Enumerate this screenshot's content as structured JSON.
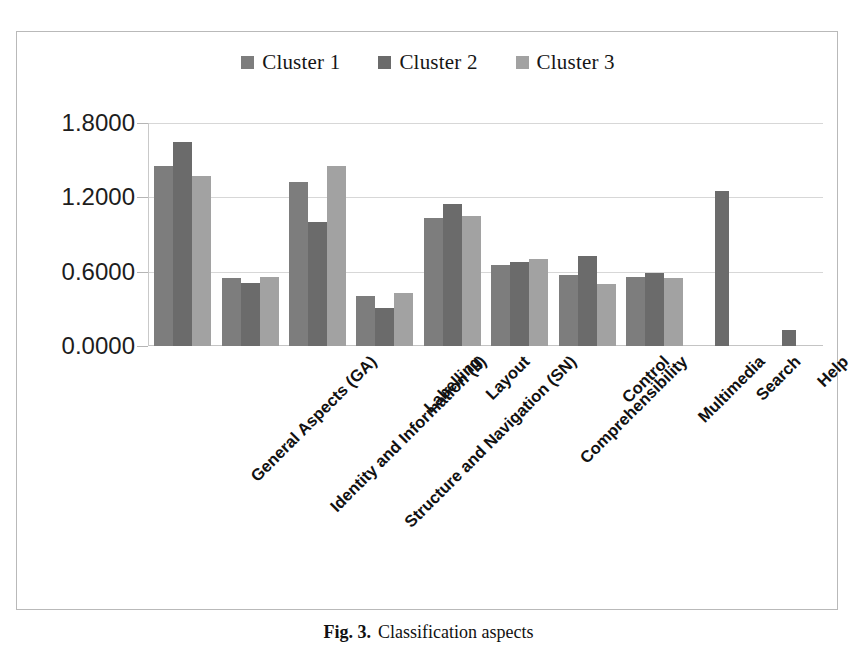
{
  "figure": {
    "caption_label": "Fig. 3.",
    "caption_text": "Classification aspects"
  },
  "legend": {
    "position": "top-center",
    "items": [
      {
        "label": "Cluster 1",
        "color": "#7d7d7d",
        "icon": "square-swatch"
      },
      {
        "label": "Cluster 2",
        "color": "#6b6b6b",
        "icon": "square-swatch"
      },
      {
        "label": "Cluster 3",
        "color": "#a2a2a2",
        "icon": "square-swatch"
      }
    ]
  },
  "axis": {
    "yticks": [
      "0.0000",
      "0.6000",
      "1.2000",
      "1.8000"
    ],
    "ytick_values": [
      0.0,
      0.6,
      1.2,
      1.8
    ]
  },
  "chart_data": {
    "type": "bar",
    "title": "Classification aspects",
    "xlabel": "",
    "ylabel": "",
    "ylim": [
      0,
      1.8
    ],
    "grid": true,
    "legend_position": "top-center",
    "categories": [
      "General Aspects (GA)",
      "Identity and Information (II)",
      "Structure and Navigation (SN)",
      "Labelling",
      "Layout",
      "Comprehensibility",
      "Control",
      "Multimedia",
      "Search",
      "Help"
    ],
    "series": [
      {
        "name": "Cluster 1",
        "color": "#7d7d7d",
        "values": [
          1.45,
          0.55,
          1.32,
          0.4,
          1.03,
          0.65,
          0.57,
          0.56,
          null,
          null
        ]
      },
      {
        "name": "Cluster 2",
        "color": "#6b6b6b",
        "values": [
          1.65,
          0.51,
          1.0,
          0.31,
          1.15,
          0.68,
          0.73,
          0.59,
          1.25,
          0.13
        ]
      },
      {
        "name": "Cluster 3",
        "color": "#a2a2a2",
        "values": [
          1.37,
          0.56,
          1.45,
          0.43,
          1.05,
          0.7,
          0.5,
          0.55,
          null,
          null
        ]
      }
    ]
  }
}
